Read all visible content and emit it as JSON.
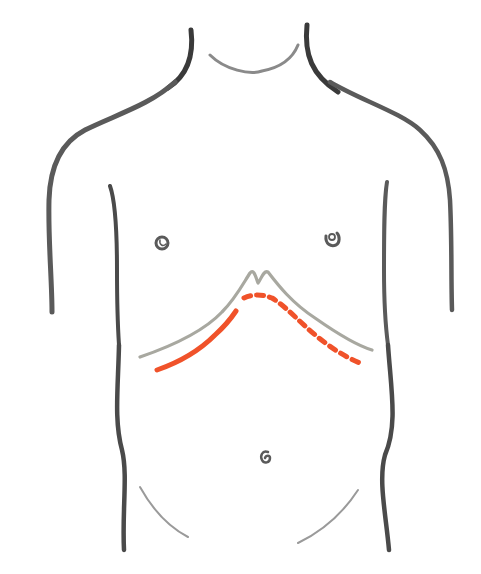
{
  "illustration": {
    "subject": "anterior torso outline with subcostal incision marking",
    "colors": {
      "background": "#ffffff",
      "outline": "#4a4a4a",
      "rib_margin": "#a8a8a0",
      "incision": "#f0522a"
    },
    "labels": []
  }
}
